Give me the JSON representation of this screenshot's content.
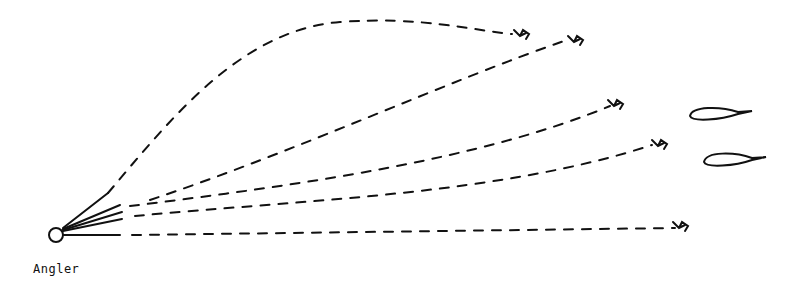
{
  "diagram": {
    "angler_label": "Angler",
    "colors": {
      "ink": "#111111",
      "background": "#ffffff"
    },
    "angler": {
      "cx": 56,
      "cy": 235,
      "r": 7
    },
    "casts": [
      {
        "name": "cast-1-high-arc",
        "end": [
          520,
          34
        ]
      },
      {
        "name": "cast-2",
        "end": [
          575,
          38
        ]
      },
      {
        "name": "cast-3",
        "end": [
          618,
          103
        ]
      },
      {
        "name": "cast-4",
        "end": [
          660,
          143
        ]
      },
      {
        "name": "cast-5-straight",
        "end": [
          685,
          223
        ]
      }
    ],
    "fish": [
      {
        "name": "fish-upper",
        "x": 688,
        "y": 112
      },
      {
        "name": "fish-lower",
        "x": 703,
        "y": 158
      }
    ]
  }
}
